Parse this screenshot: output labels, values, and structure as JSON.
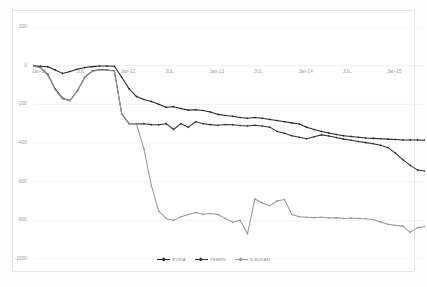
{
  "chart_data": {
    "type": "line",
    "title": "",
    "xlabel": "",
    "ylabel": "",
    "ylim": [
      -1000,
      200
    ],
    "ytick_labels": [
      "200",
      "0",
      "-200",
      "-400",
      "-600",
      "-800",
      "-1000"
    ],
    "ytick_values": [
      200,
      0,
      -200,
      -400,
      -600,
      -800,
      -1000
    ],
    "grid": true,
    "legend_position": "bottom-center",
    "xtick_labels": [
      "Jan-11",
      "JUL",
      "Jan-12",
      "JUL",
      "Jan-13",
      "JUL",
      "Jan-14",
      "JUL",
      "Jan-15"
    ],
    "xtick_values": [
      0,
      6,
      12,
      18,
      24,
      30,
      36,
      42,
      48
    ],
    "xlim": [
      0,
      53
    ],
    "colors": {
      "syria": "#262626",
      "yemen": "#333333",
      "s_sudan": "#9a9a9a",
      "gridline": "#ececec",
      "axis_text": "#9a9a9a",
      "frame": "#e6e6e6",
      "background": "#ffffff"
    },
    "series": [
      {
        "name": "SYRIA",
        "color": "#262626",
        "marker": "diamond",
        "values": [
          0,
          -3,
          -6,
          -22,
          -40,
          -30,
          -18,
          -10,
          -5,
          -2,
          -2,
          -3,
          -60,
          -120,
          -160,
          -175,
          -185,
          -200,
          -215,
          -212,
          -222,
          -230,
          -228,
          -232,
          -240,
          -252,
          -258,
          -262,
          -268,
          -272,
          -268,
          -272,
          -278,
          -284,
          -290,
          -296,
          -302,
          -318,
          -330,
          -340,
          -348,
          -356,
          -362,
          -366,
          -370,
          -374,
          -376,
          -378,
          -380,
          -382,
          -384,
          -384,
          -385,
          -386
        ]
      },
      {
        "name": "YEMEN",
        "color": "#333333",
        "marker": "diamond",
        "values": [
          0,
          -10,
          -45,
          -120,
          -168,
          -180,
          -130,
          -60,
          -28,
          -20,
          -22,
          -26,
          -250,
          -300,
          -302,
          -300,
          -305,
          -306,
          -300,
          -330,
          -300,
          -318,
          -290,
          -300,
          -305,
          -308,
          -304,
          -306,
          -310,
          -312,
          -308,
          -312,
          -318,
          -340,
          -350,
          -362,
          -370,
          -378,
          -368,
          -358,
          -364,
          -372,
          -380,
          -386,
          -392,
          -398,
          -404,
          -412,
          -424,
          -452,
          -486,
          -516,
          -540,
          -545
        ]
      },
      {
        "name": "S SUDAN",
        "color": "#9a9a9a",
        "marker": "diamond",
        "values": [
          0,
          -12,
          -50,
          -125,
          -172,
          -182,
          -132,
          -62,
          -30,
          -22,
          -24,
          -28,
          -252,
          -302,
          -304,
          -430,
          -620,
          -752,
          -790,
          -800,
          -782,
          -770,
          -760,
          -768,
          -765,
          -770,
          -790,
          -810,
          -800,
          -870,
          -690,
          -710,
          -724,
          -700,
          -692,
          -770,
          -782,
          -784,
          -786,
          -784,
          -788,
          -786,
          -790,
          -788,
          -790,
          -792,
          -796,
          -808,
          -820,
          -826,
          -830,
          -862,
          -838,
          -832
        ]
      }
    ]
  }
}
